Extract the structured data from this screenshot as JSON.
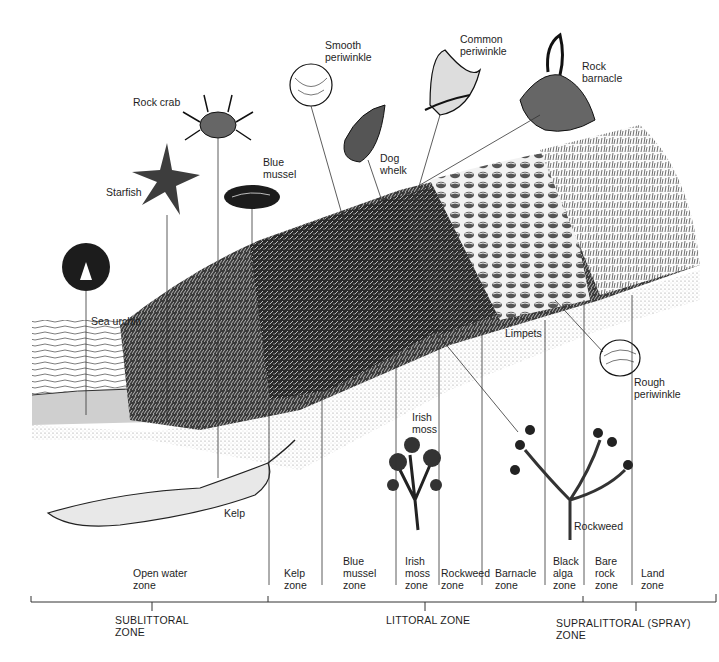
{
  "diagram": {
    "type": "rocky-shore-zonation-illustration",
    "colors": {
      "ink": "#1a1a1a",
      "background": "#ffffff",
      "stipple": "#8a8a8a"
    },
    "organisms": [
      {
        "id": "sea-urchin",
        "label": "Sea urchin"
      },
      {
        "id": "starfish",
        "label": "Starfish"
      },
      {
        "id": "rock-crab",
        "label": "Rock crab"
      },
      {
        "id": "blue-mussel",
        "label": "Blue\nmussel"
      },
      {
        "id": "smooth-periwinkle",
        "label": "Smooth\nperiwinkle"
      },
      {
        "id": "dog-whelk",
        "label": "Dog\nwhelk"
      },
      {
        "id": "common-periwinkle",
        "label": "Common\nperiwinkle"
      },
      {
        "id": "rock-barnacle",
        "label": "Rock\nbarnacle"
      },
      {
        "id": "limpets",
        "label": "Limpets"
      },
      {
        "id": "rough-periwinkle",
        "label": "Rough\nperiwinkle"
      },
      {
        "id": "kelp",
        "label": "Kelp"
      },
      {
        "id": "irish-moss",
        "label": "Irish\nmoss"
      },
      {
        "id": "rockweed",
        "label": "Rockweed"
      }
    ],
    "zones": [
      {
        "id": "open-water",
        "label": "Open water\nzone"
      },
      {
        "id": "kelp",
        "label": "Kelp\nzone"
      },
      {
        "id": "blue-mussel",
        "label": "Blue\nmussel\nzone"
      },
      {
        "id": "irish-moss",
        "label": "Irish\nmoss\nzone"
      },
      {
        "id": "rockweed",
        "label": "Rockweed\nzone"
      },
      {
        "id": "barnacle",
        "label": "Barnacle\nzone"
      },
      {
        "id": "black-alga",
        "label": "Black\nalga\nzone"
      },
      {
        "id": "bare-rock",
        "label": "Bare\nrock\nzone"
      },
      {
        "id": "land",
        "label": "Land\nzone"
      }
    ],
    "zone_groups": [
      {
        "id": "sublittoral",
        "label": "SUBLITTORAL\nZONE"
      },
      {
        "id": "littoral",
        "label": "LITTORAL ZONE"
      },
      {
        "id": "supralittoral",
        "label": "SUPRALITTORAL (SPRAY)\nZONE"
      }
    ]
  }
}
